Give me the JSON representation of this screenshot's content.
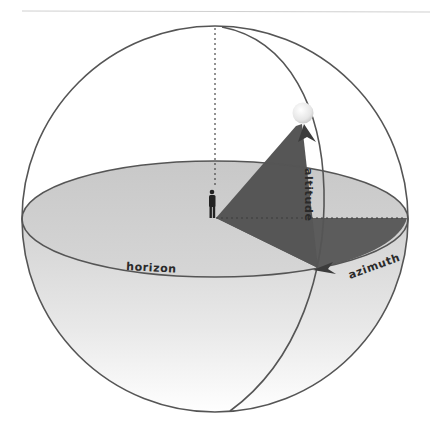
{
  "diagram": {
    "labels": {
      "altitude": "altitude",
      "azimuth": "azimuth",
      "horizon": "horizon"
    },
    "elements": {
      "sphere": "celestial-sphere",
      "horizon_plane": "horizon-ellipse",
      "zenith_line": "dashed-zenith-line",
      "meridian": "vertical-circle-through-sun",
      "observer": "person-figure",
      "sun": "sun-sphere",
      "altitude_angle": "altitude-triangle",
      "azimuth_angle": "azimuth-wedge"
    },
    "colors": {
      "outline": "#555555",
      "wedge": "#5a5a5a",
      "horizon_fill_top": "#c9c9c9",
      "horizon_fill_bottom": "#e6e6e6",
      "sun": "#eeeeee",
      "label": "#2a2a2a",
      "divider": "#cfcfcf"
    }
  }
}
